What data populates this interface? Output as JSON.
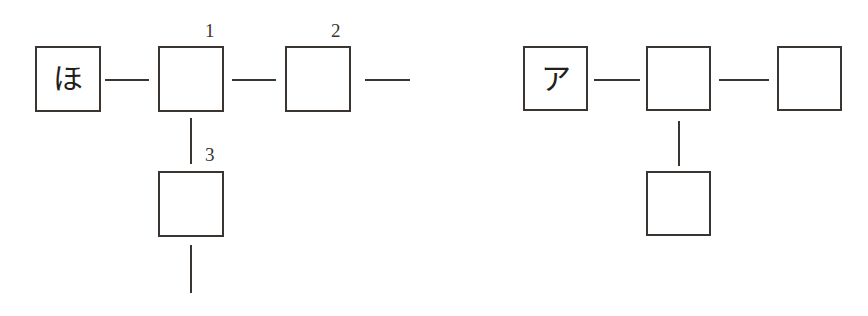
{
  "diagram": {
    "background_color": "#ffffff",
    "stroke_color": "#3a3530",
    "glyph_color": "#241f1c",
    "groups": [
      {
        "id": "left-group",
        "name": "left-chain",
        "boxes": [
          {
            "id": "left-box-start",
            "glyph": "ほ",
            "label": "",
            "x": 35,
            "y": 46,
            "w": 66,
            "h": 66,
            "filled": true
          },
          {
            "id": "left-box-1",
            "glyph": "",
            "label": "1",
            "x": 158,
            "y": 46,
            "w": 66,
            "h": 66,
            "filled": false
          },
          {
            "id": "left-box-2",
            "glyph": "",
            "label": "2",
            "x": 285,
            "y": 46,
            "w": 66,
            "h": 66,
            "filled": false
          },
          {
            "id": "left-box-3",
            "glyph": "",
            "label": "3",
            "x": 158,
            "y": 171,
            "w": 66,
            "h": 66,
            "filled": false
          }
        ],
        "edges": [
          {
            "id": "left-edge-start-1",
            "orient": "h",
            "x": 105,
            "y": 79,
            "len": 44
          },
          {
            "id": "left-edge-1-2",
            "orient": "h",
            "x": 232,
            "y": 79,
            "len": 44
          },
          {
            "id": "left-edge-2-open",
            "orient": "h",
            "x": 365,
            "y": 79,
            "len": 45
          },
          {
            "id": "left-edge-1-3",
            "orient": "v",
            "x": 190,
            "y": 118,
            "len": 46
          },
          {
            "id": "left-edge-3-open",
            "orient": "v",
            "x": 190,
            "y": 245,
            "len": 48
          }
        ],
        "labels": [
          {
            "id": "left-label-1",
            "text": "1",
            "x": 205,
            "y": 21
          },
          {
            "id": "left-label-2",
            "text": "2",
            "x": 331,
            "y": 21
          },
          {
            "id": "left-label-3",
            "text": "3",
            "x": 205,
            "y": 145
          }
        ]
      },
      {
        "id": "right-group",
        "name": "right-chain",
        "boxes": [
          {
            "id": "right-box-start",
            "glyph": "ア",
            "label": "",
            "x": 523,
            "y": 46,
            "w": 65,
            "h": 65,
            "filled": true
          },
          {
            "id": "right-box-1",
            "glyph": "",
            "label": "",
            "x": 646,
            "y": 46,
            "w": 65,
            "h": 65,
            "filled": false
          },
          {
            "id": "right-box-2",
            "glyph": "",
            "label": "",
            "x": 777,
            "y": 46,
            "w": 65,
            "h": 65,
            "filled": false
          },
          {
            "id": "right-box-3",
            "glyph": "",
            "label": "",
            "x": 646,
            "y": 171,
            "w": 65,
            "h": 65,
            "filled": false
          }
        ],
        "edges": [
          {
            "id": "right-edge-start-1",
            "orient": "h",
            "x": 594,
            "y": 79,
            "len": 46
          },
          {
            "id": "right-edge-1-2",
            "orient": "h",
            "x": 719,
            "y": 79,
            "len": 50
          },
          {
            "id": "right-edge-1-3",
            "orient": "v",
            "x": 678,
            "y": 121,
            "len": 45
          }
        ],
        "labels": []
      }
    ]
  }
}
